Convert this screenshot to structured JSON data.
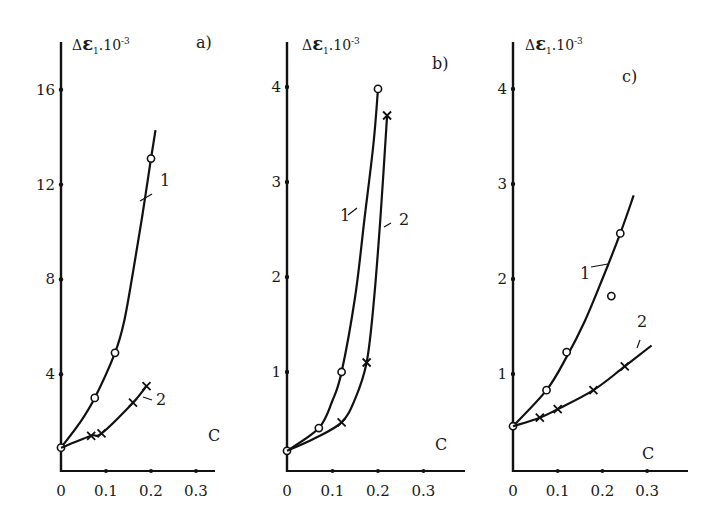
{
  "figure": {
    "panels": [
      "a)",
      "b)",
      "c)"
    ]
  },
  "chart_data": [
    {
      "type": "line",
      "panel_label": "a)",
      "title": "",
      "ylabel": "ΔE1·10^-3",
      "ylabel_parts": {
        "delta": "Δ",
        "symbol": "ε",
        "subscript": "1",
        "mult": ".10",
        "sup": "-3"
      },
      "xlabel": "C",
      "xticks": [
        "0",
        "0.1",
        "0.2",
        "0.3"
      ],
      "yticks": [
        "4",
        "8",
        "12",
        "16"
      ],
      "xlim": [
        0,
        0.33
      ],
      "ylim": [
        0,
        17
      ],
      "grid": false,
      "series": [
        {
          "name": "1",
          "marker": "circle",
          "points": [
            [
              0,
              0.9
            ],
            [
              0.075,
              3.0
            ],
            [
              0.12,
              4.9
            ],
            [
              0.2,
              13.1
            ]
          ],
          "curve": [
            [
              0,
              0.9
            ],
            [
              0.04,
              1.9
            ],
            [
              0.075,
              3.0
            ],
            [
              0.12,
              4.9
            ],
            [
              0.14,
              6.2
            ],
            [
              0.16,
              8.3
            ],
            [
              0.18,
              10.6
            ],
            [
              0.2,
              13.1
            ],
            [
              0.21,
              14.3
            ]
          ]
        },
        {
          "name": "2",
          "marker": "cross",
          "points": [
            [
              0.067,
              1.4
            ],
            [
              0.09,
              1.5
            ],
            [
              0.16,
              2.8
            ],
            [
              0.19,
              3.5
            ]
          ],
          "curve": [
            [
              0,
              0.9
            ],
            [
              0.067,
              1.4
            ],
            [
              0.09,
              1.5
            ],
            [
              0.16,
              2.8
            ],
            [
              0.19,
              3.5
            ]
          ]
        }
      ]
    },
    {
      "type": "line",
      "panel_label": "b)",
      "title": "",
      "ylabel": "ΔE1·10^-3",
      "ylabel_parts": {
        "delta": "Δ",
        "symbol": "ε",
        "subscript": "1",
        "mult": ".10",
        "sup": "-3"
      },
      "xlabel": "C",
      "xticks": [
        "0",
        "0.1",
        "0.2",
        "0.3"
      ],
      "yticks": [
        "1",
        "2",
        "3",
        "4"
      ],
      "xlim": [
        0,
        0.35
      ],
      "ylim": [
        0,
        4.4
      ],
      "grid": false,
      "series": [
        {
          "name": "1",
          "marker": "circle",
          "points": [
            [
              0,
              0.17
            ],
            [
              0.07,
              0.41
            ],
            [
              0.12,
              1.0
            ],
            [
              0.2,
              3.98
            ]
          ],
          "curve": [
            [
              0,
              0.17
            ],
            [
              0.07,
              0.41
            ],
            [
              0.1,
              0.7
            ],
            [
              0.12,
              1.0
            ],
            [
              0.15,
              1.8
            ],
            [
              0.17,
              2.6
            ],
            [
              0.19,
              3.4
            ],
            [
              0.2,
              3.98
            ]
          ]
        },
        {
          "name": "2",
          "marker": "cross",
          "points": [
            [
              0.12,
              0.47
            ],
            [
              0.175,
              1.1
            ],
            [
              0.22,
              3.7
            ]
          ],
          "curve": [
            [
              0,
              0.17
            ],
            [
              0.06,
              0.3
            ],
            [
              0.12,
              0.47
            ],
            [
              0.15,
              0.72
            ],
            [
              0.175,
              1.1
            ],
            [
              0.19,
              1.7
            ],
            [
              0.205,
              2.6
            ],
            [
              0.22,
              3.7
            ]
          ]
        }
      ]
    },
    {
      "type": "line",
      "panel_label": "c)",
      "title": "",
      "ylabel": "ΔE1·10^-3",
      "ylabel_parts": {
        "delta": "Δ",
        "symbol": "ε",
        "subscript": "1",
        "mult": ".10",
        "sup": "-3"
      },
      "xlabel": "C",
      "xticks": [
        "0",
        "0.1",
        "0.2",
        "0.3"
      ],
      "yticks": [
        "1",
        "2",
        "3",
        "4"
      ],
      "xlim": [
        0,
        0.35
      ],
      "ylim": [
        0,
        4.4
      ],
      "grid": false,
      "series": [
        {
          "name": "1",
          "marker": "circle",
          "points": [
            [
              0,
              0.45
            ],
            [
              0.075,
              0.83
            ],
            [
              0.12,
              1.23
            ],
            [
              0.22,
              1.82
            ],
            [
              0.24,
              2.48
            ]
          ],
          "curve": [
            [
              0,
              0.45
            ],
            [
              0.075,
              0.83
            ],
            [
              0.12,
              1.18
            ],
            [
              0.16,
              1.55
            ],
            [
              0.2,
              2.0
            ],
            [
              0.24,
              2.48
            ],
            [
              0.27,
              2.88
            ]
          ]
        },
        {
          "name": "2",
          "marker": "cross",
          "points": [
            [
              0.06,
              0.54
            ],
            [
              0.1,
              0.63
            ],
            [
              0.18,
              0.83
            ],
            [
              0.25,
              1.08
            ]
          ],
          "curve": [
            [
              0,
              0.45
            ],
            [
              0.06,
              0.54
            ],
            [
              0.1,
              0.63
            ],
            [
              0.18,
              0.83
            ],
            [
              0.25,
              1.08
            ],
            [
              0.31,
              1.3
            ]
          ]
        }
      ]
    }
  ]
}
